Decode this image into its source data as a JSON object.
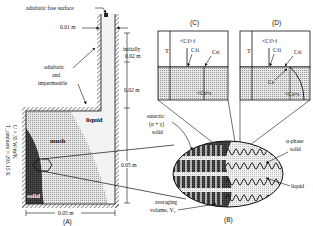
{
  "figure": {
    "panels": {
      "A": {
        "caption": "(A)"
      },
      "B": {
        "caption": "(B)"
      },
      "C": {
        "caption": "(C)"
      },
      "D": {
        "caption": "(D)"
      }
    },
    "panel_a": {
      "adiabatic_free_surface": "adiabatic free surface",
      "riser_width": "0.01 m",
      "initially": "initially",
      "initial_height": "0.02 m",
      "riser_height": "0.02 m",
      "cavity_height": "0.05 m",
      "cavity_width": "0.05 m",
      "wall_label_1": "adiabatic",
      "wall_label_2": "and",
      "wall_label_3": "impermeable",
      "region_liquid": "liquid",
      "region_mush": "mush",
      "region_solid": "solid",
      "bc_u": "U = 35 W/m²K",
      "bc_t": "T_ambient = 293.15 K"
    },
    "panel_b": {
      "eutectic_1": "eutectic",
      "eutectic_2": "(α + γ)",
      "eutectic_3": "solid",
      "alpha_1": "α-phase",
      "alpha_2": "solid",
      "liquid": "liquid",
      "avg_1": "averaging",
      "avg_2": "volume, V₀"
    },
    "panel_c": {
      "T": "T",
      "cl_avg": "<Cℓ>ℓ",
      "cli": "Cℓi",
      "csi": "Csi",
      "cs_avg": "<Cs>s"
    },
    "panel_d": {
      "T": "T",
      "cl_avg": "<Cℓ>ℓ",
      "cli": "Cℓi",
      "csi": "Csi",
      "cs": "Cs",
      "cs_avg": "<Cs>s"
    }
  },
  "colors": {
    "line": "#111111",
    "solid_region": "#3a3a3a",
    "mush_region": "#c9c9c9",
    "liquid_region": "#ececec",
    "background": "#ffffff"
  }
}
